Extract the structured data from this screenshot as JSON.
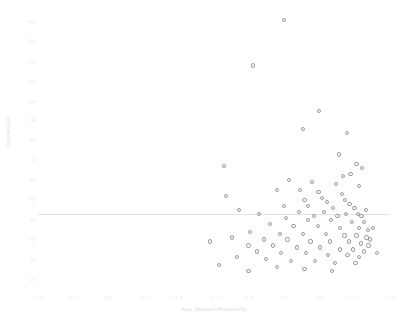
{
  "top_strip": {
    "fragments": [
      "",
      "",
      "",
      "",
      "",
      "",
      "",
      ""
    ]
  },
  "chart_data": {
    "type": "scatter",
    "title": "",
    "xlabel": "Avg. Always+Frequently",
    "ylabel": "DenRes10k",
    "xlim": [
      0.0,
      1.0
    ],
    "ylim": [
      5,
      145
    ],
    "grid": false,
    "legend": null,
    "marker_style": "open-circle",
    "marker_color": "#9a9a9a",
    "reference_line": {
      "orientation": "horizontal",
      "y": 43,
      "color": "#e3e3e3"
    },
    "xticks": [
      "0.0",
      "0.1",
      "0.2",
      "0.3",
      "0.4",
      "0.5",
      "0.6",
      "0.7",
      "0.8",
      "0.9",
      "1.0"
    ],
    "xtick_values": [
      0.0,
      0.1,
      0.2,
      0.3,
      0.4,
      0.5,
      0.6,
      0.7,
      0.8,
      0.9,
      1.0
    ],
    "yticks": [
      "140",
      "130",
      "120",
      "110",
      "100",
      "90",
      "80",
      "70",
      "60",
      "50",
      "40",
      "30",
      "20",
      "10"
    ],
    "ytick_values": [
      140,
      130,
      120,
      110,
      100,
      90,
      80,
      70,
      60,
      50,
      40,
      30,
      20,
      10
    ],
    "points": [
      [
        0.699,
        141
      ],
      [
        0.611,
        118
      ],
      [
        0.799,
        95
      ],
      [
        0.752,
        86
      ],
      [
        0.878,
        84
      ],
      [
        0.529,
        67
      ],
      [
        0.905,
        68
      ],
      [
        0.921,
        66
      ],
      [
        0.888,
        63
      ],
      [
        0.866,
        62
      ],
      [
        0.713,
        60
      ],
      [
        0.778,
        59
      ],
      [
        0.846,
        58
      ],
      [
        0.912,
        57
      ],
      [
        0.679,
        55
      ],
      [
        0.744,
        55
      ],
      [
        0.797,
        54
      ],
      [
        0.864,
        53
      ],
      [
        0.533,
        52
      ],
      [
        0.806,
        51
      ],
      [
        0.872,
        50
      ],
      [
        0.757,
        50
      ],
      [
        0.822,
        49
      ],
      [
        0.885,
        48
      ],
      [
        0.698,
        47
      ],
      [
        0.766,
        47
      ],
      [
        0.838,
        46
      ],
      [
        0.899,
        46
      ],
      [
        0.572,
        45
      ],
      [
        0.931,
        45
      ],
      [
        0.741,
        44
      ],
      [
        0.812,
        44
      ],
      [
        0.876,
        43
      ],
      [
        0.908,
        43
      ],
      [
        0.627,
        43
      ],
      [
        0.783,
        42
      ],
      [
        0.851,
        42
      ],
      [
        0.919,
        42
      ],
      [
        0.704,
        41
      ],
      [
        0.768,
        40
      ],
      [
        0.833,
        40
      ],
      [
        0.893,
        39
      ],
      [
        0.926,
        39
      ],
      [
        0.659,
        38
      ],
      [
        0.726,
        37
      ],
      [
        0.795,
        37
      ],
      [
        0.857,
        36
      ],
      [
        0.911,
        36
      ],
      [
        0.938,
        35
      ],
      [
        0.602,
        34
      ],
      [
        0.688,
        33
      ],
      [
        0.752,
        33
      ],
      [
        0.818,
        33
      ],
      [
        0.871,
        32
      ],
      [
        0.905,
        32
      ],
      [
        0.933,
        31
      ],
      [
        0.944,
        30
      ],
      [
        0.551,
        31
      ],
      [
        0.641,
        30
      ],
      [
        0.709,
        30
      ],
      [
        0.774,
        29
      ],
      [
        0.829,
        29
      ],
      [
        0.884,
        29
      ],
      [
        0.917,
        28
      ],
      [
        0.939,
        27
      ],
      [
        0.489,
        29
      ],
      [
        0.598,
        27
      ],
      [
        0.667,
        27
      ],
      [
        0.736,
        26
      ],
      [
        0.801,
        26
      ],
      [
        0.858,
        25
      ],
      [
        0.896,
        25
      ],
      [
        0.927,
        24
      ],
      [
        0.622,
        24
      ],
      [
        0.691,
        23
      ],
      [
        0.761,
        23
      ],
      [
        0.824,
        22
      ],
      [
        0.879,
        22
      ],
      [
        0.913,
        21
      ],
      [
        0.566,
        21
      ],
      [
        0.648,
        20
      ],
      [
        0.718,
        19
      ],
      [
        0.788,
        19
      ],
      [
        0.844,
        18
      ],
      [
        0.902,
        18
      ],
      [
        0.679,
        16
      ],
      [
        0.757,
        15
      ],
      [
        0.836,
        14
      ],
      [
        0.515,
        17
      ],
      [
        0.598,
        14
      ],
      [
        0.962,
        23
      ],
      [
        0.951,
        36
      ],
      [
        0.856,
        73
      ]
    ]
  }
}
